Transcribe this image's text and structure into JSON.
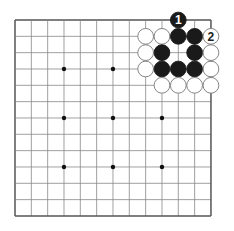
{
  "board": {
    "size": 13,
    "origin_x": 15,
    "origin_y": 20,
    "spacing": 16.33,
    "line_color": "#888888",
    "border_color": "#555555",
    "star_points": [
      [
        3,
        3
      ],
      [
        3,
        6
      ],
      [
        6,
        3
      ],
      [
        6,
        6
      ],
      [
        6,
        9
      ],
      [
        9,
        3
      ],
      [
        9,
        6
      ],
      [
        9,
        9
      ],
      [
        3,
        9
      ]
    ],
    "stones": [
      {
        "color": "black",
        "col": 10,
        "row": 0,
        "label": "1"
      },
      {
        "color": "white",
        "col": 8,
        "row": 1
      },
      {
        "color": "white",
        "col": 9,
        "row": 1
      },
      {
        "color": "black",
        "col": 10,
        "row": 1
      },
      {
        "color": "black",
        "col": 11,
        "row": 1
      },
      {
        "color": "white",
        "col": 12,
        "row": 1,
        "label": "2"
      },
      {
        "color": "white",
        "col": 8,
        "row": 2
      },
      {
        "color": "black",
        "col": 9,
        "row": 2
      },
      {
        "color": "black",
        "col": 11,
        "row": 2
      },
      {
        "color": "white",
        "col": 12,
        "row": 2
      },
      {
        "color": "white",
        "col": 8,
        "row": 3
      },
      {
        "color": "black",
        "col": 9,
        "row": 3
      },
      {
        "color": "black",
        "col": 10,
        "row": 3
      },
      {
        "color": "black",
        "col": 11,
        "row": 3
      },
      {
        "color": "white",
        "col": 12,
        "row": 3
      },
      {
        "color": "white",
        "col": 9,
        "row": 4
      },
      {
        "color": "white",
        "col": 10,
        "row": 4
      },
      {
        "color": "white",
        "col": 11,
        "row": 4
      },
      {
        "color": "white",
        "col": 12,
        "row": 4
      }
    ]
  }
}
